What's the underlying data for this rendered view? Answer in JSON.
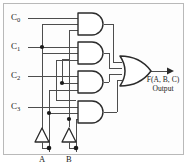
{
  "figure": {
    "width": 188,
    "height": 165,
    "background": "#fdfdfd",
    "border_color": "#b9b9b9",
    "wire_color": "#4d4d4d",
    "gate_color": "#2b2b2b",
    "text_color": "#1a1a1a"
  },
  "data_inputs": [
    {
      "id": "c0",
      "label": "C",
      "subscript": "0",
      "x": 14,
      "y": 18
    },
    {
      "id": "c1",
      "label": "C",
      "subscript": "1",
      "x": 14,
      "y": 47
    },
    {
      "id": "c2",
      "label": "C",
      "subscript": "2",
      "x": 14,
      "y": 76
    },
    {
      "id": "c3",
      "label": "C",
      "subscript": "3",
      "x": 14,
      "y": 107
    }
  ],
  "select_inputs": [
    {
      "id": "a",
      "label": "A",
      "x": 42,
      "y": 156
    },
    {
      "id": "b",
      "label": "B",
      "x": 69,
      "y": 156
    }
  ],
  "inverters": [
    {
      "id": "inv-a",
      "input": "A",
      "x": 38,
      "y": 131
    },
    {
      "id": "inv-b",
      "input": "B",
      "x": 65,
      "y": 131
    }
  ],
  "and_gates": [
    {
      "id": "and-0",
      "inputs": [
        "C0",
        "A'",
        "B'"
      ],
      "x": 78,
      "y": 13
    },
    {
      "id": "and-1",
      "inputs": [
        "C1",
        "A'",
        "B"
      ],
      "x": 78,
      "y": 42
    },
    {
      "id": "and-2",
      "inputs": [
        "C2",
        "A",
        "B'"
      ],
      "x": 78,
      "y": 71
    },
    {
      "id": "and-3",
      "inputs": [
        "C3",
        "A",
        "B"
      ],
      "x": 78,
      "y": 101
    }
  ],
  "or_gate": {
    "id": "or-out",
    "inputs": [
      "and-0",
      "and-1",
      "and-2",
      "and-3"
    ],
    "x": 122,
    "y": 57
  },
  "output": {
    "expression": "F(A, B, C)",
    "caption": "Output",
    "x": 171,
    "y": 78
  }
}
